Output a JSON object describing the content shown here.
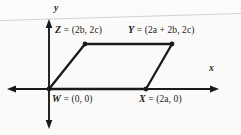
{
  "figure": {
    "kind": "coordinate-plane-parallelogram",
    "background_color": "#fbfbfa",
    "ink_color": "#1a1a1a",
    "artifact_color": "#cfcfcf",
    "axes": {
      "x_label": "x",
      "y_label": "y",
      "x_axis": {
        "x1": 8,
        "y1": 89,
        "x2": 218,
        "y2": 89,
        "arrow_start": true,
        "arrow_end": true
      },
      "y_axis": {
        "x1": 49,
        "y1": 20,
        "x2": 49,
        "y2": 128,
        "arrow_start": true,
        "arrow_end": true
      },
      "origin": {
        "x": 49,
        "y": 89
      }
    },
    "vertices": [
      {
        "id": "W",
        "name": "W",
        "coords": "(0, 0)",
        "label": "W = (0, 0)",
        "px": 49,
        "py": 89,
        "dot": true
      },
      {
        "id": "X",
        "name": "X",
        "coords": "(2a, 0)",
        "label": "X = (2a, 0)",
        "px": 146,
        "py": 89,
        "dot": true
      },
      {
        "id": "Y",
        "name": "Y",
        "coords": "(2a + 2b, 2c)",
        "label": "Y = (2a + 2b, 2c)",
        "px": 172,
        "py": 44,
        "dot": true
      },
      {
        "id": "Z",
        "name": "Z",
        "coords": "(2b, 2c)",
        "label": "Z = (2b, 2c)",
        "px": 85,
        "py": 44,
        "dot": true
      }
    ],
    "labels": {
      "z": {
        "vertex": "Z",
        "equals": " = (2b, 2c)"
      },
      "y": {
        "vertex": "Y",
        "equals": " = (2a + 2b, 2c)"
      },
      "w": {
        "vertex": "W",
        "equals": " = (0, 0)"
      },
      "x": {
        "vertex": "X",
        "equals": " = (2a, 0)"
      }
    },
    "polygon": {
      "name": "parallelogram-wxyz",
      "order": [
        "W",
        "X",
        "Y",
        "Z"
      ],
      "points": "49,89 146,89 172,44 85,44",
      "stroke_width": 2.2
    }
  }
}
